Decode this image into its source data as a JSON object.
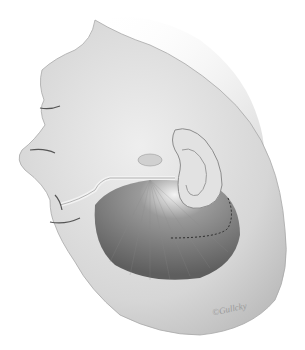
{
  "illustration": {
    "subject": "surgical head illustration with ear and dashed incision line",
    "signature": "©Gullcky",
    "colors": {
      "background": "#ffffff",
      "skin_light": "#e6e6e6",
      "skin_mid": "#c8c8c8",
      "shadow": "#6e6e6e",
      "incision": "#222222"
    }
  }
}
